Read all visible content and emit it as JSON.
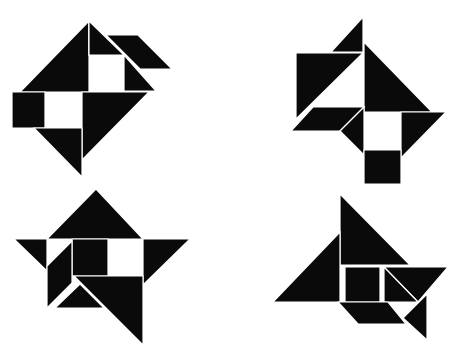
{
  "colors": {
    "background": "#ffffff",
    "piece": "#0a0a0a",
    "seam": "#ffffff"
  },
  "figures": [
    {
      "name": "figure-top-left",
      "pieces": [
        {
          "kind": "large-triangle",
          "points": "89,21 89,92 20,92"
        },
        {
          "kind": "small-triangle",
          "points": "89,21 106,38 89,55"
        },
        {
          "kind": "small-triangle-top",
          "points": "89,21 124,55 89,55"
        },
        {
          "kind": "parallelogram",
          "points": "106,35 138,35 172,69 140,69"
        },
        {
          "kind": "small-triangle",
          "points": "124,55 124,91 156,91"
        },
        {
          "kind": "square",
          "points": "12,92 45,92 45,128 12,128"
        },
        {
          "kind": "large-triangle",
          "points": "82,92 149,92 82,160"
        },
        {
          "kind": "medium-triangle",
          "points": "34,128 82,128 82,177"
        }
      ]
    },
    {
      "name": "figure-top-right",
      "pieces": [
        {
          "kind": "small-triangle",
          "points": "363,17 363,52 331,52"
        },
        {
          "kind": "large-triangle",
          "points": "296,53 363,53 296,119"
        },
        {
          "kind": "large-triangle",
          "points": "364,42 432,112 364,112"
        },
        {
          "kind": "parallelogram",
          "points": "313,107 364,107 340,131 291,131"
        },
        {
          "kind": "small-triangle",
          "points": "340,131 364,107 364,155"
        },
        {
          "kind": "medium-triangle",
          "points": "401,112 446,112 401,158"
        },
        {
          "kind": "square",
          "points": "364,150 401,150 401,184 364,184"
        }
      ]
    },
    {
      "name": "figure-bottom-left",
      "pieces": [
        {
          "kind": "large-triangle",
          "points": "96,189 143,239 47,239"
        },
        {
          "kind": "small-triangle",
          "points": "14,239 47,239 47,271"
        },
        {
          "kind": "medium-triangle",
          "points": "143,239 190,239 143,285"
        },
        {
          "kind": "square",
          "points": "72,239 108,239 108,276 72,276"
        },
        {
          "kind": "parallelogram",
          "points": "72,241 72,283 47,308 47,266"
        },
        {
          "kind": "large-triangle",
          "points": "74,276 143,276 143,345"
        },
        {
          "kind": "small-triangle",
          "points": "55,308 80,284 104,308"
        }
      ]
    },
    {
      "name": "figure-bottom-right",
      "pieces": [
        {
          "kind": "large-triangle",
          "points": "340,194 410,265 340,265"
        },
        {
          "kind": "large-triangle",
          "points": "273,302 340,232 340,302"
        },
        {
          "kind": "square",
          "points": "345,267 380,267 380,302 345,302"
        },
        {
          "kind": "medium-triangle",
          "points": "384,267 448,267 418,302"
        },
        {
          "kind": "small-triangle",
          "points": "384,267 418,302 384,302"
        },
        {
          "kind": "parallelogram",
          "points": "338,302 388,302 406,324 358,324"
        },
        {
          "kind": "small-triangle",
          "points": "403,318 427,294 427,340"
        }
      ]
    }
  ]
}
